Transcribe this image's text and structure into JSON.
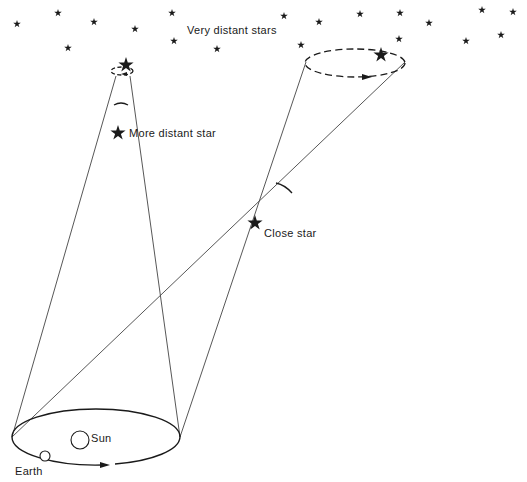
{
  "diagram": {
    "labels": {
      "very_distant_stars": "Very distant stars",
      "more_distant_star": "More distant star",
      "close_star": "Close star",
      "sun": "Sun",
      "earth": "Earth"
    },
    "colors": {
      "ink": "#1a1a1a",
      "line": "#444444",
      "background": "#ffffff"
    },
    "background_stars": [
      [
        17,
        24
      ],
      [
        58,
        13
      ],
      [
        94,
        22
      ],
      [
        135,
        29
      ],
      [
        172,
        13
      ],
      [
        174,
        41
      ],
      [
        68,
        48
      ],
      [
        217,
        49
      ],
      [
        284,
        16
      ],
      [
        319,
        22
      ],
      [
        301,
        45
      ],
      [
        360,
        14
      ],
      [
        400,
        13
      ],
      [
        429,
        23
      ],
      [
        399,
        39
      ],
      [
        482,
        10
      ],
      [
        513,
        12
      ],
      [
        466,
        41
      ],
      [
        501,
        35
      ]
    ]
  }
}
